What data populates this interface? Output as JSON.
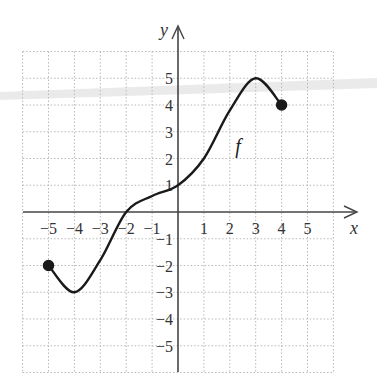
{
  "chart_data": {
    "type": "line",
    "title": "",
    "xlabel": "x",
    "ylabel": "y",
    "function_label": "f",
    "xlim": [
      -6,
      6
    ],
    "ylim": [
      -6,
      6
    ],
    "grid": true,
    "grid_style": "dotted",
    "x_ticks": [
      "-5",
      "-4",
      "-3",
      "-2",
      "-1",
      "1",
      "2",
      "3",
      "4",
      "5"
    ],
    "y_ticks": [
      "5",
      "4",
      "3",
      "2",
      "1",
      "-1",
      "-2",
      "-3",
      "-4",
      "-5"
    ],
    "series": [
      {
        "name": "f",
        "points": [
          {
            "x": -5,
            "y": -2
          },
          {
            "x": -4,
            "y": -3
          },
          {
            "x": -3,
            "y": -1.8
          },
          {
            "x": -2,
            "y": 0
          },
          {
            "x": -1,
            "y": 0.6
          },
          {
            "x": 0,
            "y": 1
          },
          {
            "x": 1,
            "y": 2
          },
          {
            "x": 2,
            "y": 3.8
          },
          {
            "x": 3,
            "y": 5
          },
          {
            "x": 4,
            "y": 4
          }
        ],
        "endpoints": [
          {
            "x": -5,
            "y": -2,
            "style": "closed"
          },
          {
            "x": 4,
            "y": 4,
            "style": "closed"
          }
        ]
      }
    ],
    "annotations": [
      {
        "text": "f",
        "x": 2.4,
        "y": 2.5
      }
    ]
  },
  "colors": {
    "curve": "#1a1a1a",
    "axes": "#444444",
    "grid": "#b8b8b8",
    "text": "#333333"
  }
}
